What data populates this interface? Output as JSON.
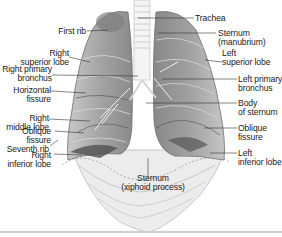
{
  "figure": {
    "labels_left": [
      {
        "id": "first-rib",
        "text": "First rib"
      },
      {
        "id": "right-superior-lobe",
        "text": "Right\nsuperior lobe"
      },
      {
        "id": "right-primary-bronchus",
        "text": "Right primary\nbronchus"
      },
      {
        "id": "horizontal-fissure",
        "text": "Horizontal\nfissure"
      },
      {
        "id": "right-middle-lobe",
        "text": "Right\nmiddle lobe"
      },
      {
        "id": "right-oblique-fissure",
        "text": "Oblique\nfissure"
      },
      {
        "id": "seventh-rib",
        "text": "Seventh rib"
      },
      {
        "id": "right-inferior-lobe",
        "text": "Right\ninferior lobe"
      }
    ],
    "labels_right": [
      {
        "id": "trachea",
        "text": "Trachea"
      },
      {
        "id": "sternum-manubrium",
        "text": "Sternum\n(manubrium)"
      },
      {
        "id": "left-superior-lobe",
        "text": "Left\nsuperior lobe"
      },
      {
        "id": "left-primary-bronchus",
        "text": "Left primary\nbronchus"
      },
      {
        "id": "body-of-sternum",
        "text": "Body\nof sternum"
      },
      {
        "id": "left-oblique-fissure",
        "text": "Oblique\nfissure"
      },
      {
        "id": "left-inferior-lobe",
        "text": "Left\ninferior lobe"
      }
    ],
    "labels_bottom": [
      {
        "id": "sternum-xiphoid",
        "text": "Sternum\n(xiphoid process)"
      }
    ]
  }
}
